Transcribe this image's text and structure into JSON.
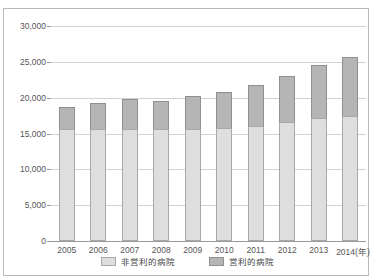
{
  "figure": {
    "title_partial": ""
  },
  "legend": {
    "position": "bottom",
    "items": [
      {
        "label": "非営利的病院",
        "key": "nonprofit",
        "color": "#dedede"
      },
      {
        "label": "営利的病院",
        "key": "forprofit",
        "color": "#b5b5b5"
      }
    ]
  },
  "axes": {
    "y_ticks": [
      "0",
      "5,000",
      "10,000",
      "15,000",
      "20,000",
      "25,000",
      "30,000"
    ],
    "x_axis_unit": "(年)"
  },
  "chart_data": {
    "type": "bar",
    "stacked": true,
    "title": "",
    "subtitle": "",
    "xlabel": "(年)",
    "ylabel": "",
    "grid": true,
    "legend_position": "bottom",
    "ylim": [
      0,
      30000
    ],
    "ytick_values": [
      0,
      5000,
      10000,
      15000,
      20000,
      25000,
      30000
    ],
    "ytick_labels": [
      "0",
      "5,000",
      "10,000",
      "15,000",
      "20,000",
      "25,000",
      "30,000"
    ],
    "categories": [
      "2005",
      "2006",
      "2007",
      "2008",
      "2009",
      "2010",
      "2011",
      "2012",
      "2013",
      "2014"
    ],
    "xtick_labels": [
      "2005",
      "2006",
      "2007",
      "2008",
      "2009",
      "2010",
      "2011",
      "2012",
      "2013",
      "2014(年)"
    ],
    "series": [
      {
        "name": "非営利的病院",
        "color": "#dedede",
        "values": [
          15600,
          15600,
          15650,
          15600,
          15600,
          15700,
          16100,
          16600,
          17100,
          17500
        ]
      },
      {
        "name": "営利的病院",
        "color": "#b5b5b5",
        "values": [
          3100,
          3600,
          4150,
          4000,
          4600,
          5100,
          5700,
          6400,
          7500,
          8200
        ]
      }
    ],
    "totals": [
      18700,
      19200,
      19800,
      19600,
      20200,
      20800,
      21800,
      23000,
      24600,
      25700
    ]
  }
}
